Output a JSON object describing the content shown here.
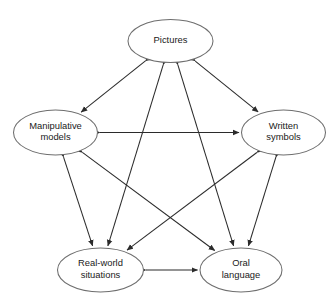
{
  "diagram": {
    "type": "node-link-graph",
    "title": "",
    "canvas": {
      "width": 336,
      "height": 305,
      "background": "#ffffff"
    },
    "style": {
      "node_fill": "#ffffff",
      "node_stroke": "#6e6e6e",
      "edge_color": "#2b2b2b",
      "text_color": "#1a1a1a",
      "arrowhead": "filled-triangle",
      "edge_direction": "bidirectional"
    },
    "nodes": [
      {
        "id": "pictures",
        "label": "Pictures",
        "lines": [
          "Pictures"
        ],
        "cx": 170.5,
        "cy": 41,
        "rx": 42.5,
        "ry": 21.5
      },
      {
        "id": "manipulative-models",
        "label": "Manipulative models",
        "lines": [
          "Manipulative",
          "models"
        ],
        "cx": 55.5,
        "cy": 132.5,
        "rx": 42,
        "ry": 22.5
      },
      {
        "id": "written-symbols",
        "label": "Written symbols",
        "lines": [
          "Written",
          "symbols"
        ],
        "cx": 283.5,
        "cy": 132.5,
        "rx": 42,
        "ry": 22.5
      },
      {
        "id": "real-world-situations",
        "label": "Real-world situations",
        "lines": [
          "Real-world",
          "situations"
        ],
        "cx": 100.5,
        "cy": 270,
        "rx": 43,
        "ry": 22
      },
      {
        "id": "oral-language",
        "label": "Oral language",
        "lines": [
          "Oral",
          "language"
        ],
        "cx": 241,
        "cy": 270,
        "rx": 41,
        "ry": 22
      }
    ],
    "edges": [
      {
        "id": "edge-pictures-manipulative-models",
        "from": "pictures",
        "to": "manipulative-models",
        "bidirectional": true
      },
      {
        "id": "edge-pictures-written-symbols",
        "from": "pictures",
        "to": "written-symbols",
        "bidirectional": true
      },
      {
        "id": "edge-pictures-real-world-situations",
        "from": "pictures",
        "to": "real-world-situations",
        "bidirectional": true
      },
      {
        "id": "edge-pictures-oral-language",
        "from": "pictures",
        "to": "oral-language",
        "bidirectional": true
      },
      {
        "id": "edge-manipulative-models-written-symbols",
        "from": "manipulative-models",
        "to": "written-symbols",
        "bidirectional": true
      },
      {
        "id": "edge-manipulative-models-real-world-situations",
        "from": "manipulative-models",
        "to": "real-world-situations",
        "bidirectional": true
      },
      {
        "id": "edge-manipulative-models-oral-language",
        "from": "manipulative-models",
        "to": "oral-language",
        "bidirectional": true
      },
      {
        "id": "edge-written-symbols-real-world-situations",
        "from": "written-symbols",
        "to": "real-world-situations",
        "bidirectional": true
      },
      {
        "id": "edge-written-symbols-oral-language",
        "from": "written-symbols",
        "to": "oral-language",
        "bidirectional": true
      },
      {
        "id": "edge-real-world-situations-oral-language",
        "from": "real-world-situations",
        "to": "oral-language",
        "bidirectional": true
      }
    ]
  }
}
